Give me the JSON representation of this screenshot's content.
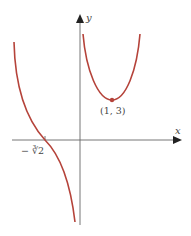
{
  "diagram": {
    "type": "function-graph",
    "axes": {
      "x_label": "x",
      "y_label": "y"
    },
    "labels": {
      "x_intercept": "− ∛2",
      "local_min_point": "(1, 3)"
    },
    "curves": [
      {
        "name": "left-branch",
        "description": "decreasing branch for x<0 crossing x-axis at −∛2, approaching −∞ as x→0⁻"
      },
      {
        "name": "right-branch",
        "description": "U-shaped branch for x>0 with local minimum at (1, 3)"
      }
    ],
    "colors": {
      "curve": "#b5433a",
      "axis": "#555555",
      "point": "#b5433a"
    }
  }
}
